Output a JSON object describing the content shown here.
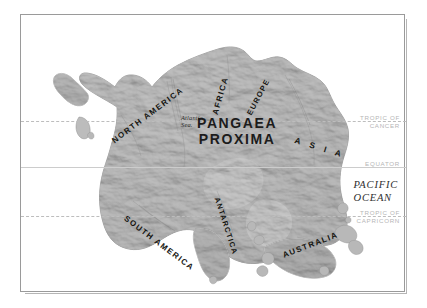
{
  "map": {
    "title": "PANGAEA\nPROXIMA",
    "sea_label": "Atlantic\nSea.",
    "ocean_label": "PACIFIC\nOCEAN",
    "continents": [
      {
        "id": "north-america",
        "label": "NORTH AMERICA"
      },
      {
        "id": "africa",
        "label": "AFRICA"
      },
      {
        "id": "europe",
        "label": "EUROPE"
      },
      {
        "id": "asia",
        "label": "A S I A"
      },
      {
        "id": "south-america",
        "label": "SOUTH AMERICA"
      },
      {
        "id": "antarctica",
        "label": "ANTARCTICA"
      },
      {
        "id": "australia",
        "label": "AUSTRALIA"
      }
    ],
    "latitudes": [
      {
        "id": "cancer",
        "label": "TROPIC OF\nCANCER",
        "style": "dashed"
      },
      {
        "id": "equator",
        "label": "EQUATOR",
        "style": "solid"
      },
      {
        "id": "capricorn",
        "label": "TROPIC OF\nCAPRICORN",
        "style": "dashed"
      }
    ],
    "colors": {
      "page_background": "#ffffff",
      "ocean": "#ffffff",
      "frame_border": "#9a9a9a",
      "land_light": "#cfcfcf",
      "land_mid": "#b4b4b4",
      "land_dark": "#8e8e8e",
      "land_edge": "#7d7d7d",
      "label_dark": "#14140f",
      "label_grey": "#b6b6b6"
    }
  }
}
